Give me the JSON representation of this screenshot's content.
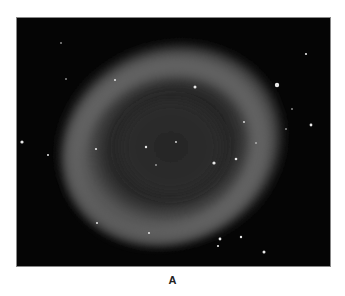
{
  "figure": {
    "label": "A",
    "colors": {
      "background": "#050505",
      "nebula": "#6a6a6a",
      "stars": "#e8e8e8"
    }
  }
}
